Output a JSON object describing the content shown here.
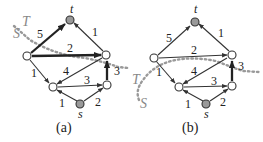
{
  "figure": {
    "type": "graph-min-cut",
    "colors": {
      "edge": "#333333",
      "terminal_fill": "#999999",
      "node_fill": "#ffffff",
      "cut_line": "#999999"
    },
    "nodes": [
      {
        "id": "t",
        "label": "t",
        "terminal": true
      },
      {
        "id": "a",
        "label": "",
        "terminal": false
      },
      {
        "id": "b",
        "label": "",
        "terminal": false
      },
      {
        "id": "c",
        "label": "",
        "terminal": false
      },
      {
        "id": "d",
        "label": "",
        "terminal": false
      },
      {
        "id": "s",
        "label": "s",
        "terminal": true
      }
    ],
    "edges": [
      {
        "from": "a",
        "to": "t",
        "weight": "5"
      },
      {
        "from": "b",
        "to": "t",
        "weight": "1"
      },
      {
        "from": "a",
        "to": "b",
        "weight": "2"
      },
      {
        "from": "a",
        "to": "c",
        "weight": "1"
      },
      {
        "from": "b",
        "to": "c",
        "weight": "4"
      },
      {
        "from": "c",
        "to": "d",
        "weight": "3"
      },
      {
        "from": "d",
        "to": "b",
        "weight": "3"
      },
      {
        "from": "s",
        "to": "c",
        "weight": "1"
      },
      {
        "from": "s",
        "to": "d",
        "weight": "2"
      }
    ],
    "panels": [
      {
        "caption": "(a)",
        "cut_labels": {
          "source_side": "S",
          "sink_side": "T"
        },
        "cut_edges": [
          "a-t",
          "a-b",
          "d-b"
        ]
      },
      {
        "caption": "(b)",
        "cut_labels": {
          "source_side": "S",
          "sink_side": "T"
        },
        "cut_edges": [
          "d-b"
        ]
      }
    ]
  }
}
